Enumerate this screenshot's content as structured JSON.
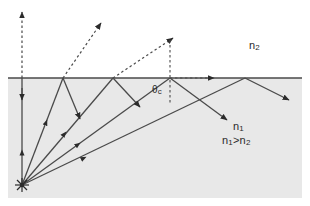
{
  "figure": {
    "width": 310,
    "height": 206,
    "background_color": "#ffffff",
    "medium_fill_color": "#e8e8e8",
    "line_color": "#4a4a4a",
    "text_color": "#2b2b2b"
  },
  "labels": {
    "upper_medium": "n",
    "upper_medium_sub": "2",
    "lower_medium": "n",
    "lower_medium_sub": "1",
    "inequality": "n",
    "inequality_sub1": "1",
    "inequality_op": ">n",
    "inequality_sub2": "2",
    "critical_angle": "θ",
    "critical_angle_sub": "c"
  },
  "geometry": {
    "interface_y": 78,
    "source": {
      "x": 22,
      "y": 185
    },
    "medium_region": {
      "x": 8,
      "y": 78,
      "width": 294,
      "height": 120
    },
    "normal_line": {
      "x": 170,
      "y_top": 36,
      "y_bottom": 104
    },
    "interface_hit_points": [
      63,
      113,
      170,
      245
    ],
    "refracted_ray_arrow_tips": [
      {
        "x": 22,
        "y": 8
      },
      {
        "x": 104,
        "y": 20
      },
      {
        "x": 177,
        "y": 36
      },
      {
        "x": 218,
        "y": 78
      }
    ],
    "reflected_ray_arrow_tips": [
      {
        "x": 82,
        "y": 122
      },
      {
        "x": 143,
        "y": 110
      },
      {
        "x": 230,
        "y": 123
      },
      {
        "x": 292,
        "y": 102
      }
    ]
  }
}
